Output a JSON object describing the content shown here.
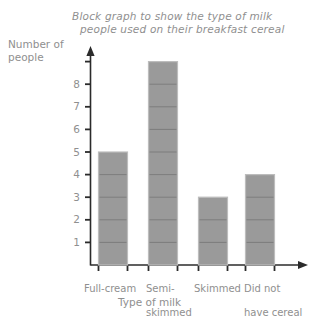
{
  "chart_data": {
    "type": "bar",
    "title": "Block graph to show the type of milk people used on their breakfast cereal",
    "title_lines": [
      "Block graph to show the type of milk",
      "people used on their breakfast cereal"
    ],
    "xlabel": "Type of milk",
    "ylabel": "Number of people",
    "ylabel_lines": [
      "Number of",
      "people"
    ],
    "categories": [
      "Full-cream",
      "Semi-skimmed",
      "Skimmed",
      "Did not have cereal"
    ],
    "category_label_lines": [
      [
        "Full-cream"
      ],
      [
        "Semi-",
        "skimmed"
      ],
      [
        "Skimmed"
      ],
      [
        "Did not",
        "have cereal"
      ]
    ],
    "values": [
      5,
      9,
      3,
      4
    ],
    "ylim": [
      0,
      9
    ],
    "ytick_labels": [
      "1",
      "2",
      "3",
      "4",
      "5",
      "6",
      "7",
      "8"
    ],
    "ytick_values": [
      1,
      2,
      3,
      4,
      5,
      6,
      7,
      8
    ],
    "unlabeled_tick_value": 9,
    "grid": false,
    "legend": "none",
    "block_style": "stacked unit blocks of 1 person each",
    "bar_color": "#9a9a9a",
    "bar_edge_color": "#bdbdbd",
    "block_divider_color": "#7d7d7d",
    "axis_color": "#2b2b2b",
    "text_color": "#8f8f8f",
    "background_color": "#ffffff"
  }
}
